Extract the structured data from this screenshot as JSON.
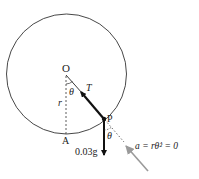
{
  "diagram": {
    "type": "physics-free-body-diagram",
    "points": {
      "center": {
        "label": "O"
      },
      "bottom": {
        "label": "A"
      },
      "particle": {
        "label": "P"
      }
    },
    "labels": {
      "radius": "r",
      "angle_top": "θ",
      "angle_bottom": "θ",
      "tension": "T",
      "weight": "0.03g",
      "acceleration": "a = rθ̇² = 0"
    },
    "colors": {
      "line": "#222222",
      "accel_arrow": "#999999"
    }
  }
}
